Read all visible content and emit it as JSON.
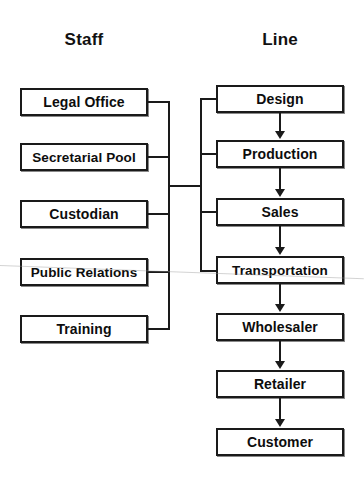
{
  "diagram": {
    "title_left": "Staff",
    "title_right": "Line",
    "columns": [
      {
        "key": "staff",
        "header": "Staff",
        "nodes": [
          {
            "label": "Legal Office"
          },
          {
            "label": "Secretarial Pool"
          },
          {
            "label": "Custodian"
          },
          {
            "label": "Public Relations"
          },
          {
            "label": "Training"
          }
        ]
      },
      {
        "key": "line",
        "header": "Line",
        "nodes": [
          {
            "label": "Design"
          },
          {
            "label": "Production"
          },
          {
            "label": "Sales"
          },
          {
            "label": "Transportation"
          },
          {
            "label": "Wholesaler"
          },
          {
            "label": "Retailer"
          },
          {
            "label": "Customer"
          }
        ]
      }
    ],
    "colors": {
      "box_border": "#1a1a1a",
      "box_fill": "#ffffff",
      "text": "#0d0d0d",
      "connector": "#1a1a1a",
      "background": "#ffffff"
    }
  }
}
